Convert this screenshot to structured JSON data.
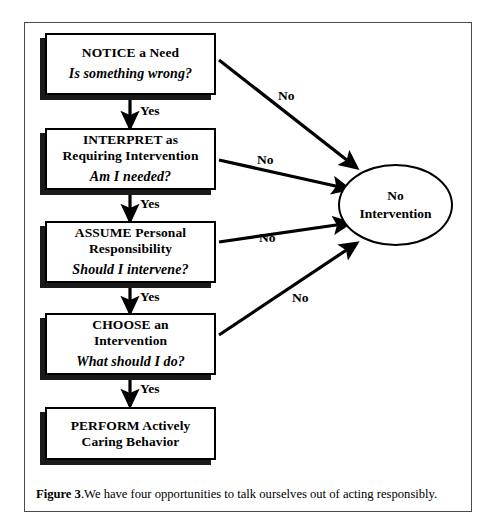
{
  "figure": {
    "caption_label": "Figure 3",
    "caption_sep": ".",
    "caption_text": "We have four opportunities to talk ourselves out of acting responsibly."
  },
  "flowchart": {
    "type": "flowchart",
    "steps": [
      {
        "id": "notice",
        "title": "NOTICE a Need",
        "question": "Is something wrong?",
        "yes_label": "Yes",
        "no_label": "No"
      },
      {
        "id": "interpret",
        "title": "INTERPRET as\nRequiring Intervention",
        "question": "Am I needed?",
        "yes_label": "Yes",
        "no_label": "No"
      },
      {
        "id": "assume",
        "title": "ASSUME Personal\nResponsibility",
        "question": "Should I intervene?",
        "yes_label": "Yes",
        "no_label": "No"
      },
      {
        "id": "choose",
        "title": "CHOOSE an\nIntervention",
        "question": "What should I do?",
        "yes_label": "Yes",
        "no_label": "No"
      },
      {
        "id": "perform",
        "title": "PERFORM Actively\nCaring Behavior",
        "question": "",
        "yes_label": "",
        "no_label": ""
      }
    ],
    "terminal": {
      "id": "no-intervention",
      "label": "No\nIntervention"
    },
    "colors": {
      "stroke": "#000000",
      "shadow": "#1a1a1a",
      "background": "#ffffff",
      "frame": "#4a4a4a"
    }
  }
}
